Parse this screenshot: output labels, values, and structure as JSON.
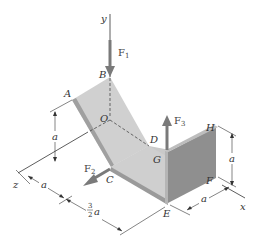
{
  "figure": {
    "type": "3D statics diagram - bent plate with forces",
    "colors": {
      "plate_light": "#d6d6d6",
      "plate_mid": "#c4c4c4",
      "plate_dark": "#8f8f8f",
      "plate_edge": "#a8a8a8",
      "force_arrow": "#7a7a7a",
      "line": "#333333"
    },
    "axes": {
      "x": "x",
      "y": "y",
      "z": "z"
    },
    "points": {
      "A": "A",
      "B": "B",
      "C": "C",
      "D": "D",
      "E": "E",
      "F": "F",
      "G": "G",
      "H": "H",
      "O": "O"
    },
    "forces": [
      {
        "name": "F",
        "subscript": "1",
        "direction": "downward along -y at B"
      },
      {
        "name": "F",
        "subscript": "2",
        "direction": "along +z at C"
      },
      {
        "name": "F",
        "subscript": "3",
        "direction": "upward along +y at G"
      }
    ],
    "dimensions": [
      {
        "label": "a",
        "meaning": "height of A above z-axis"
      },
      {
        "label": "a",
        "meaning": "offset along z-axis"
      },
      {
        "label_num": "3",
        "label_den": "2",
        "label_var": "a",
        "meaning": "distance along x-direction from C to E"
      },
      {
        "label": "a",
        "meaning": "height H to F"
      },
      {
        "label": "a",
        "meaning": "distance E to F along x"
      }
    ]
  }
}
